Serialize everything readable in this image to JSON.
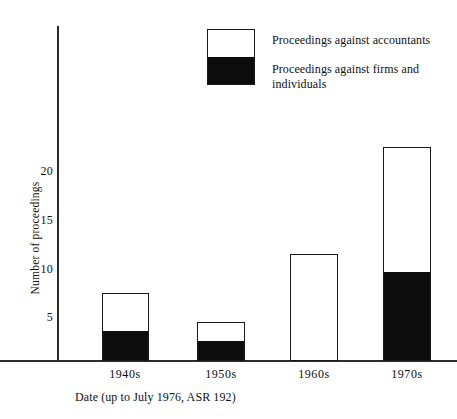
{
  "chart_data": {
    "type": "bar",
    "subtype": "stacked",
    "title": "",
    "xlabel": "Date (up to July 1976, ASR 192)",
    "ylabel": "Number of proceedings",
    "categories": [
      "1940s",
      "1950s",
      "1960s",
      "1970s"
    ],
    "yticks": [
      5,
      10,
      15,
      20
    ],
    "ylim": [
      0,
      24
    ],
    "grid": false,
    "legend_position": "top-center",
    "series": [
      {
        "name": "Proceedings against firms and individuals",
        "color": "#0d0d0d",
        "values": [
          3,
          2,
          0,
          9
        ]
      },
      {
        "name": "Proceedings against accountants",
        "color": "#ffffff",
        "values": [
          4,
          2,
          11,
          13
        ]
      }
    ],
    "totals": [
      7,
      4,
      11,
      22
    ]
  },
  "legend": {
    "items": [
      {
        "label": "Proceedings against accountants"
      },
      {
        "label": "Proceedings against firms and individuals"
      }
    ]
  },
  "axis": {
    "y_title": "Number of proceedings",
    "x_title": "Date (up to July 1976, ASR 192)",
    "y_tick_labels": [
      "20",
      "15",
      "10",
      "5"
    ],
    "x_tick_labels": [
      "1940s",
      "1950s",
      "1960s",
      "1970s"
    ]
  }
}
